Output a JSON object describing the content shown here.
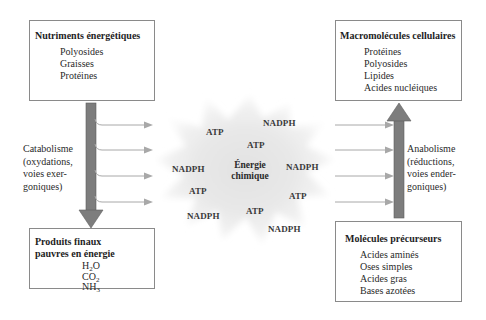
{
  "diagram": {
    "colors": {
      "bar_fill": "#7d7d7d",
      "bar_edge": "#5a5a5a",
      "arrow": "#a8a8a8",
      "box_border": "#8a8a8a",
      "burst": "#d9d9d9"
    },
    "top_left_box": {
      "title": "Nutriments énergétiques",
      "items": [
        "Polyosides",
        "Graisses",
        "Protéines"
      ]
    },
    "bottom_left_box": {
      "title_line1": "Produits finaux",
      "title_line2": "pauvres en énergie",
      "items": [
        {
          "base": "H",
          "sub": "2",
          "rest": "O"
        },
        {
          "base": "CO",
          "sub": "2",
          "rest": ""
        },
        {
          "base": "NH",
          "sub": "3",
          "rest": ""
        }
      ]
    },
    "top_right_box": {
      "title": "Macromolécules cellulaires",
      "items": [
        "Protéines",
        "Polyosides",
        "Lipides",
        "Acides nucléiques"
      ]
    },
    "bottom_right_box": {
      "title": "Molécules précurseurs",
      "items": [
        "Acides aminés",
        "Oses simples",
        "Acides gras",
        "Bases azotées"
      ]
    },
    "left_process": {
      "lines": [
        "Catabolisme",
        "(oxydations,",
        "voies exer-",
        "goniques)"
      ]
    },
    "right_process": {
      "lines": [
        "Anabolisme",
        "(réductions,",
        "voies ender-",
        "goniques)"
      ]
    },
    "center": {
      "line1": "Énergie",
      "line2": "chimique"
    },
    "molecules": [
      {
        "label": "ATP",
        "x": 206,
        "y": 127
      },
      {
        "label": "NADPH",
        "x": 263,
        "y": 118
      },
      {
        "label": "ATP",
        "x": 247,
        "y": 140
      },
      {
        "label": "NADPH",
        "x": 172,
        "y": 164
      },
      {
        "label": "NADPH",
        "x": 286,
        "y": 162
      },
      {
        "label": "ATP",
        "x": 189,
        "y": 186
      },
      {
        "label": "ATP",
        "x": 289,
        "y": 191
      },
      {
        "label": "ATP",
        "x": 246,
        "y": 206
      },
      {
        "label": "NADPH",
        "x": 187,
        "y": 211
      },
      {
        "label": "NADPH",
        "x": 268,
        "y": 224
      }
    ]
  }
}
